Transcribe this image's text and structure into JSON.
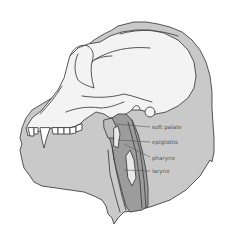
{
  "diagram": {
    "colors": {
      "skin": "#c9c9c9",
      "skull": "#f3f3f3",
      "throat": "#9c9c9c",
      "ink": "#444444",
      "label": "#555555"
    },
    "labels": [
      {
        "id": "soft-palate",
        "text": "soft palate"
      },
      {
        "id": "epiglottis",
        "text": "epiglottis"
      },
      {
        "id": "pharynx",
        "text": "pharynx"
      },
      {
        "id": "larynx",
        "text": "larynx"
      }
    ]
  }
}
